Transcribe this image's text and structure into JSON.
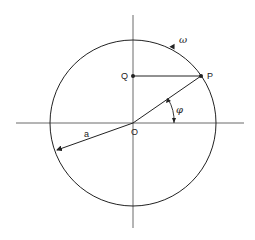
{
  "diagram": {
    "labels": {
      "omega": "ω",
      "P": "P",
      "Q": "Q",
      "phi": "φ",
      "O": "O",
      "a": "a"
    },
    "geometry": {
      "center": [
        133,
        123
      ],
      "radius": 83,
      "point_P": [
        201,
        76
      ],
      "point_Q": [
        133,
        76
      ],
      "radius_a_end": [
        57,
        151
      ]
    },
    "colors": {
      "line": "#222222",
      "background": "#ffffff"
    }
  }
}
